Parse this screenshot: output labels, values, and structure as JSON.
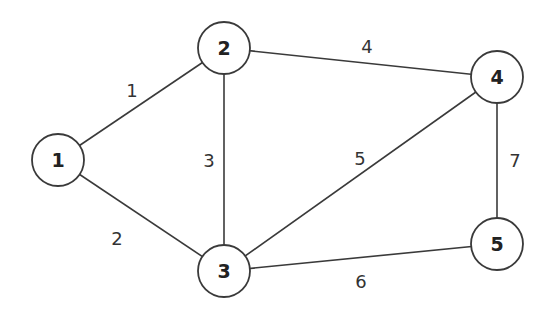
{
  "graph": {
    "title": "",
    "nodes": [
      {
        "id": "1",
        "label": "1",
        "x": 58,
        "y": 160
      },
      {
        "id": "2",
        "label": "2",
        "x": 224,
        "y": 48
      },
      {
        "id": "3",
        "label": "3",
        "x": 224,
        "y": 271
      },
      {
        "id": "4",
        "label": "4",
        "x": 497,
        "y": 77
      },
      {
        "id": "5",
        "label": "5",
        "x": 497,
        "y": 244
      }
    ],
    "edges": [
      {
        "from": "1",
        "to": "2",
        "weight": "1",
        "lx": 132,
        "ly": 90
      },
      {
        "from": "1",
        "to": "3",
        "weight": "2",
        "lx": 117,
        "ly": 238
      },
      {
        "from": "2",
        "to": "3",
        "weight": "3",
        "lx": 209,
        "ly": 160
      },
      {
        "from": "2",
        "to": "4",
        "weight": "4",
        "lx": 367,
        "ly": 46
      },
      {
        "from": "3",
        "to": "4",
        "weight": "5",
        "lx": 360,
        "ly": 158
      },
      {
        "from": "3",
        "to": "5",
        "weight": "6",
        "lx": 361,
        "ly": 281
      },
      {
        "from": "4",
        "to": "5",
        "weight": "7",
        "lx": 515,
        "ly": 160
      }
    ],
    "node_radius": 26,
    "colors": {
      "stroke": "#3a3a3a",
      "fill": "#ffffff",
      "text": "#222222"
    }
  }
}
